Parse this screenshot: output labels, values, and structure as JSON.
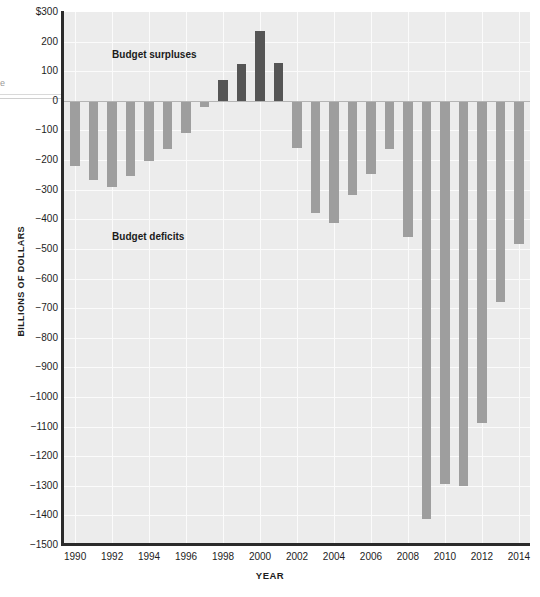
{
  "chart_data": {
    "type": "bar",
    "title": "",
    "xlabel": "YEAR",
    "ylabel": "BILLIONS OF DOLLARS",
    "ylim": [
      -1500,
      300
    ],
    "ytick_values": [
      300,
      200,
      100,
      0,
      -100,
      -200,
      -300,
      -400,
      -500,
      -600,
      -700,
      -800,
      -900,
      -1000,
      -1100,
      -1200,
      -1300,
      -1400,
      -1500
    ],
    "ytick_labels": [
      "$300",
      "200",
      "100",
      "0",
      "−100",
      "−200",
      "−300",
      "−400",
      "−500",
      "−600",
      "−700",
      "−800",
      "−900",
      "−1000",
      "−1100",
      "−1200",
      "−1300",
      "−1400",
      "−1500"
    ],
    "xtick_labels": [
      "1990",
      "1992",
      "1994",
      "1996",
      "1998",
      "2000",
      "2002",
      "2004",
      "2006",
      "2008",
      "2010",
      "2012",
      "2014"
    ],
    "xlim": [
      1989.4,
      2014.6
    ],
    "grid": true,
    "legend": "none",
    "categories": [
      1990,
      1991,
      1992,
      1993,
      1994,
      1995,
      1996,
      1997,
      1998,
      1999,
      2000,
      2001,
      2002,
      2003,
      2004,
      2005,
      2006,
      2007,
      2008,
      2009,
      2010,
      2011,
      2012,
      2013,
      2014
    ],
    "values": [
      -221,
      -269,
      -290,
      -255,
      -203,
      -164,
      -107,
      -22,
      69,
      126,
      236,
      128,
      -158,
      -378,
      -413,
      -318,
      -248,
      -161,
      -459,
      -1413,
      -1294,
      -1300,
      -1087,
      -680,
      -485
    ],
    "series": [
      {
        "name": "Federal budget surplus/deficit",
        "values": [
          -221,
          -269,
          -290,
          -255,
          -203,
          -164,
          -107,
          -22,
          69,
          126,
          236,
          128,
          -158,
          -378,
          -413,
          -318,
          -248,
          -161,
          -459,
          -1413,
          -1294,
          -1300,
          -1087,
          -680,
          -485
        ]
      }
    ],
    "annotations": [
      {
        "text": "Budget surpluses",
        "x": 1992.0,
        "y": 155
      },
      {
        "text": "Budget deficits",
        "x": 1992.0,
        "y": -460
      }
    ],
    "colors": {
      "deficit_bar": "#9e9e9e",
      "surplus_bar": "#555555",
      "plot_background": "#ececec",
      "gridline": "#fbfbfb",
      "zero_line": "#b4b4b4",
      "axis": "#2b2b2b",
      "text": "#1d1d1d"
    }
  },
  "edge_fragment": "e"
}
